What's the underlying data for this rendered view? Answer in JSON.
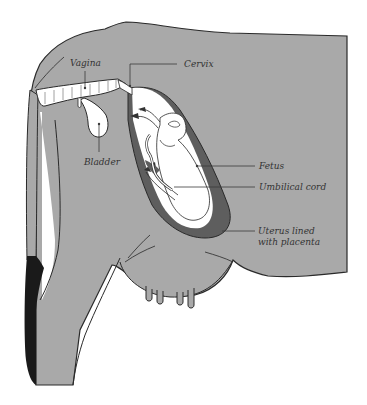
{
  "diagram": {
    "colors": {
      "body": "#a9a9a9",
      "outline": "#2a2a2a",
      "uterus_placenta": "#5e5e5e",
      "organ_interior": "#ffffff",
      "tail_tip": "#1a1a1a",
      "leader_line": "#3a3a3a",
      "label_text": "#333333"
    },
    "labels": {
      "vagina": "Vagina",
      "cervix": "Cervix",
      "bladder": "Bladder",
      "fetus": "Fetus",
      "umbilical_cord": "Umbilical cord",
      "uterus_line1": "Uterus lined",
      "uterus_line2": "with placenta"
    }
  }
}
